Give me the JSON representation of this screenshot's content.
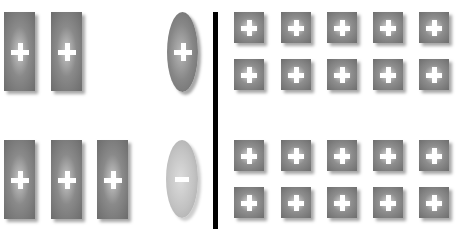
{
  "diagram": {
    "description": "Charge arrangement diagram: plate charges vs. point charges separated by a vertical divider",
    "colors": {
      "positive_charge": "#7a7a7a",
      "negative_charge": "#c2c2c2",
      "divider": "#000000",
      "symbol": "#ffffff",
      "background": "#ffffff"
    },
    "left_panel": {
      "top_row": {
        "plates": [
          {
            "sign": "+",
            "x": 4,
            "y": 12
          },
          {
            "sign": "+",
            "x": 51,
            "y": 12
          }
        ],
        "ellipse": {
          "sign": "+",
          "x": 167,
          "y": 12
        }
      },
      "bottom_row": {
        "plates": [
          {
            "sign": "+",
            "x": 4,
            "y": 140
          },
          {
            "sign": "+",
            "x": 51,
            "y": 140
          },
          {
            "sign": "+",
            "x": 97,
            "y": 140
          }
        ],
        "ellipse": {
          "sign": "−",
          "x": 166,
          "y": 140
        }
      }
    },
    "right_panel": {
      "grid_columns_x": [
        234,
        281,
        327,
        373,
        419
      ],
      "rows": [
        {
          "y": 12,
          "signs": [
            "+",
            "+",
            "+",
            "+",
            "+"
          ]
        },
        {
          "y": 59,
          "signs": [
            "+",
            "+",
            "+",
            "+",
            "+"
          ]
        },
        {
          "y": 140,
          "signs": [
            "+",
            "+",
            "+",
            "+",
            "+"
          ]
        },
        {
          "y": 187,
          "signs": [
            "+",
            "+",
            "+",
            "+",
            "+"
          ]
        }
      ]
    }
  }
}
